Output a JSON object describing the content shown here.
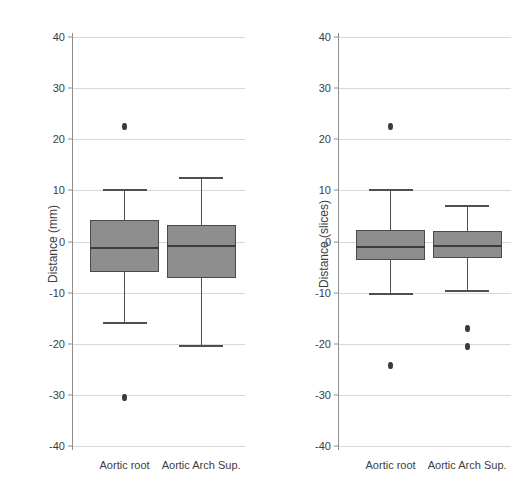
{
  "chart_data": [
    {
      "type": "box",
      "panel": "left",
      "title": "",
      "xlabel": "",
      "ylabel": "Distance (mm)",
      "ylim": [
        -40,
        40
      ],
      "yticks": [
        40,
        30,
        20,
        10,
        0,
        -10,
        -20,
        -30,
        -40
      ],
      "ytick_labels": [
        "40",
        "30",
        "20",
        "10",
        "0",
        "-10",
        "-20",
        "-30",
        "-40"
      ],
      "grid": true,
      "legend": "none",
      "categories": [
        "Aortic root",
        "Aortic Arch Sup."
      ],
      "boxes": [
        {
          "category": "Aortic root",
          "whisker_high": 10.0,
          "q3": 4.3,
          "median": -1.2,
          "q1": -5.9,
          "whisker_low": -15.9,
          "outliers": [
            22.4,
            -30.5
          ]
        },
        {
          "category": "Aortic Arch Sup.",
          "whisker_high": 12.4,
          "q3": 3.3,
          "median": -0.9,
          "q1": -7.2,
          "whisker_low": -20.4,
          "outliers": []
        }
      ]
    },
    {
      "type": "box",
      "panel": "right",
      "title": "",
      "xlabel": "",
      "ylabel": "Distance (slices)",
      "ylim": [
        -40,
        40
      ],
      "yticks": [
        40,
        30,
        20,
        10,
        0,
        -10,
        -20,
        -30,
        -40
      ],
      "ytick_labels": [
        "40",
        "30",
        "20",
        "10",
        "0",
        "-10",
        "-20",
        "-30",
        "-40"
      ],
      "grid": true,
      "legend": "none",
      "categories": [
        "Aortic root",
        "Aortic Arch Sup."
      ],
      "boxes": [
        {
          "category": "Aortic root",
          "whisker_high": 10.0,
          "q3": 2.2,
          "median": -1.0,
          "q1": -3.7,
          "whisker_low": -10.3,
          "outliers": [
            22.4,
            -24.2
          ]
        },
        {
          "category": "Aortic Arch Sup.",
          "whisker_high": 7.0,
          "q3": 2.0,
          "median": -0.9,
          "q1": -3.3,
          "whisker_low": -9.7,
          "outliers": [
            -17.0,
            -20.5
          ]
        }
      ]
    }
  ],
  "style": {
    "box_fill": "#8e8e8e",
    "box_border": "#4a4a4a",
    "median_color": "#3c3c3c",
    "whisker_color": "#4f4f4f",
    "grid_color": "#d8d8d8",
    "axis_color": "#8d8d8d",
    "text_color": "#3d3d3d",
    "background": "#ffffff"
  }
}
